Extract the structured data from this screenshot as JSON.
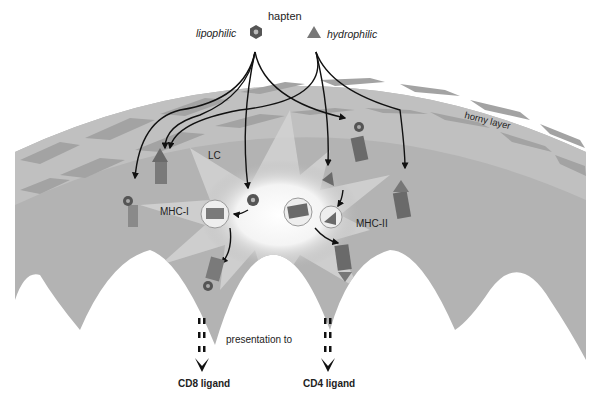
{
  "title": "hapten",
  "legend": {
    "lipophilic": "lipophilic",
    "hydrophilic": "hydrophilic"
  },
  "labels": {
    "horny_layer": "horny layer",
    "lc": "LC",
    "mhc1": "MHC-I",
    "mhc2": "MHC-II",
    "presentation": "presentation to",
    "cd8": "CD8 ligand",
    "cd4": "CD4 ligand"
  },
  "colors": {
    "skin": "#b3b3b3",
    "horny_brick": "#a3a3a3",
    "horny_mortar": "#c4c4c4",
    "molecule": "#7a7a7a",
    "hapten": "#555555",
    "arrow": "#111111"
  }
}
